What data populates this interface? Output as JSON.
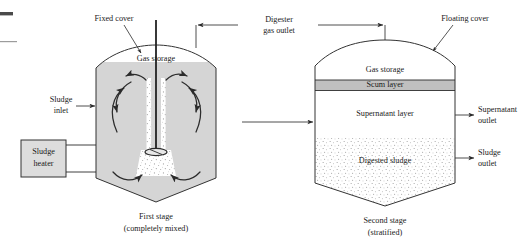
{
  "figure": {
    "colors": {
      "tank_fill_gray": "#d5d5d5",
      "scum_layer_gray": "#c0c0c0",
      "stipple_dot": "#9a9a9a",
      "line_dark": "#2b2b2b",
      "background": "#ffffff"
    }
  },
  "stage1": {
    "cover_label": "Fixed cover",
    "gas_storage_label": "Gas storage",
    "inlet_label_line1": "Sludge",
    "inlet_label_line2": "inlet",
    "heater_label_line1": "Sludge",
    "heater_label_line2": "heater",
    "caption_line1": "First stage",
    "caption_line2": "(completely mixed)"
  },
  "gas_outlet": {
    "label_line1": "Digester",
    "label_line2": "gas outlet"
  },
  "stage2": {
    "cover_label": "Floating cover",
    "layers": [
      {
        "name": "gas-storage",
        "label": "Gas storage"
      },
      {
        "name": "scum-layer",
        "label": "Scum layer"
      },
      {
        "name": "supernatant-layer",
        "label": "Supernatant layer"
      },
      {
        "name": "digested-sludge",
        "label": "Digested sludge"
      }
    ],
    "supernatant_outlet_line1": "Supernatant",
    "supernatant_outlet_line2": "outlet",
    "sludge_outlet_line1": "Sludge",
    "sludge_outlet_line2": "outlet",
    "caption_line1": "Second stage",
    "caption_line2": "(stratified)"
  }
}
